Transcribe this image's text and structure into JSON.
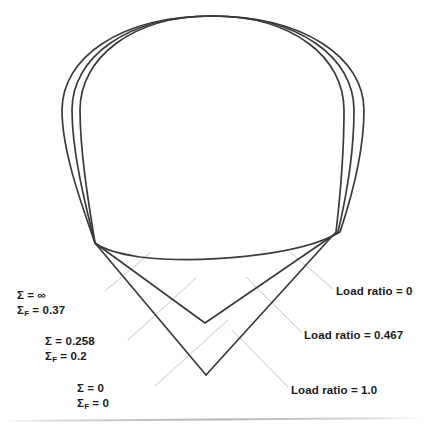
{
  "figure": {
    "type": "line-diagram",
    "background_color": "#ffffff",
    "curve_color": "#3a3a3a",
    "leader_color": "#c9c9c9",
    "baseline_color": "#cfcfcf",
    "text_color": "#1a1a1a"
  },
  "annotations": {
    "left": [
      {
        "name": "sigma-infinite",
        "line1_pre": "Σ = ",
        "line1_val": "∞",
        "line2_pre": "Σ",
        "line2_sub": "F",
        "line2_eq": " = ",
        "line2_val": "0.37"
      },
      {
        "name": "sigma-0258",
        "line1_pre": "Σ = ",
        "line1_val": "0.258",
        "line2_pre": "Σ",
        "line2_sub": "F",
        "line2_eq": " = ",
        "line2_val": "0.2"
      },
      {
        "name": "sigma-zero",
        "line1_pre": "Σ = ",
        "line1_val": "0",
        "line2_pre": "Σ",
        "line2_sub": "F",
        "line2_eq": " = ",
        "line2_val": "0"
      }
    ],
    "right": [
      {
        "name": "load-ratio-0",
        "text": "Load ratio = 0"
      },
      {
        "name": "load-ratio-0467",
        "text": "Load ratio = 0.467"
      },
      {
        "name": "load-ratio-10",
        "text": "Load ratio = 1.0"
      }
    ]
  },
  "curves": [
    {
      "name": "outer-curve-load-ratio-0",
      "sigma": "∞",
      "sigma_f": "0.37",
      "load_ratio": "0",
      "path": "M 95,243 C 80,200 62,150 62,110 C 62,58 120,16 212,16 C 304,16 364,58 364,110 C 364,152 352,196 340,232 C 300,256 200,264 140,257 C 120,254 104,250 95,243 Z"
    },
    {
      "name": "middle-curve-load-ratio-0467",
      "sigma": "0.258",
      "sigma_f": "0.2",
      "load_ratio": "0.467",
      "path": "M 95,243 C 84,200 72,150 72,110 C 72,58 126,16 212,16 C 300,16 354,58 354,110 C 354,152 346,198 338,232 L 205,323 Z"
    },
    {
      "name": "inner-curve-load-ratio-10",
      "sigma": "0",
      "sigma_f": "0",
      "load_ratio": "1.0",
      "path": "M 95,243 C 88,200 80,150 80,110 C 80,58 132,16 212,16 C 294,16 344,58 344,110 C 344,152 340,198 336,232 L 206,375 Z"
    }
  ],
  "leaders": [
    {
      "name": "leader-sigma-infinite",
      "x1": 105,
      "y1": 291,
      "x2": 150,
      "y2": 253
    },
    {
      "name": "leader-sigma-0258",
      "x1": 128,
      "y1": 340,
      "x2": 196,
      "y2": 278
    },
    {
      "name": "leader-sigma-zero",
      "x1": 155,
      "y1": 386,
      "x2": 228,
      "y2": 320
    },
    {
      "name": "leader-load-ratio-0",
      "x1": 333,
      "y1": 289,
      "x2": 290,
      "y2": 252
    },
    {
      "name": "leader-load-ratio-0467",
      "x1": 301,
      "y1": 332,
      "x2": 246,
      "y2": 277
    },
    {
      "name": "leader-load-ratio-10",
      "x1": 288,
      "y1": 387,
      "x2": 232,
      "y2": 330
    }
  ],
  "baseline": {
    "name": "bottom-rule",
    "x1": 4,
    "y1": 421,
    "x2": 420,
    "y2": 418
  }
}
